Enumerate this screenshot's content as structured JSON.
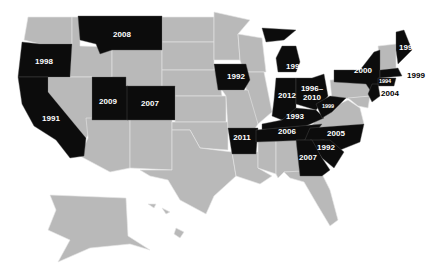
{
  "map": {
    "title": "",
    "legend": "",
    "highlight_color": "#0c0c0c",
    "base_color": "#b9b9b9",
    "states": [
      {
        "id": "WA",
        "label": ""
      },
      {
        "id": "OR",
        "label": "1998"
      },
      {
        "id": "CA",
        "label": "1991"
      },
      {
        "id": "MT",
        "label": "2008"
      },
      {
        "id": "UT",
        "label": "2009"
      },
      {
        "id": "CO",
        "label": "2007"
      },
      {
        "id": "IA",
        "label": "1992"
      },
      {
        "id": "AR",
        "label": "2011"
      },
      {
        "id": "MI",
        "label": "1995"
      },
      {
        "id": "IN",
        "label": "2012"
      },
      {
        "id": "OH",
        "label": "1996–2010"
      },
      {
        "id": "KY",
        "label": "1993"
      },
      {
        "id": "WV",
        "label": "1999"
      },
      {
        "id": "TN",
        "label": "2006"
      },
      {
        "id": "NC",
        "label": "2005"
      },
      {
        "id": "SC",
        "label": "1992"
      },
      {
        "id": "GA",
        "label": "2007"
      },
      {
        "id": "NY",
        "label": "2000"
      },
      {
        "id": "ME",
        "label": "1999"
      },
      {
        "id": "MA",
        "label": "1999"
      },
      {
        "id": "CT",
        "label": "1994"
      },
      {
        "id": "NJ",
        "label": "2004"
      }
    ]
  }
}
